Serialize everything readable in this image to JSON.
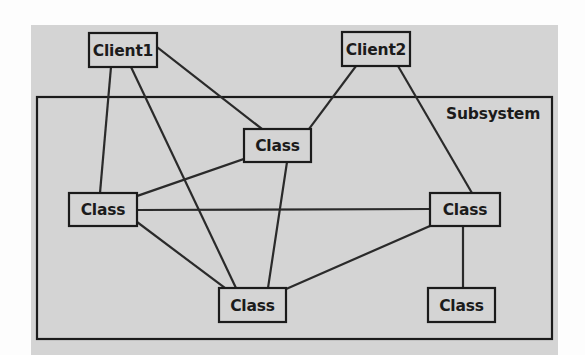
{
  "figure": {
    "background_color": "#fdfdfd",
    "panel": {
      "name": "diagram-panel",
      "fill": "#d4d4d4",
      "x": 31,
      "y": 25,
      "width": 527,
      "height": 330
    },
    "container": {
      "label": "Subsystem",
      "stroke": "#1b1b1b",
      "fill": "#d4d4d4",
      "x": 37,
      "y": 97,
      "width": 515,
      "height": 242,
      "label_x": 446,
      "label_y": 119
    },
    "node_style": {
      "fill": "#d4d4d4",
      "stroke": "#1b1b1b",
      "stroke_width": 2.2,
      "text_color": "#1b1b1b"
    },
    "edge_style": {
      "stroke": "#2a2a2a",
      "stroke_width": 2.2
    }
  },
  "nodes": [
    {
      "id": "client1",
      "label": "Client1",
      "x": 89,
      "y": 33,
      "width": 68,
      "height": 34,
      "group": "outside"
    },
    {
      "id": "client2",
      "label": "Client2",
      "x": 342,
      "y": 32,
      "width": 68,
      "height": 34,
      "group": "outside"
    },
    {
      "id": "class_mid",
      "label": "Class",
      "x": 244,
      "y": 129,
      "width": 67,
      "height": 33,
      "group": "subsystem"
    },
    {
      "id": "class_left",
      "label": "Class",
      "x": 69,
      "y": 193,
      "width": 68,
      "height": 33,
      "group": "subsystem"
    },
    {
      "id": "class_right",
      "label": "Class",
      "x": 430,
      "y": 193,
      "width": 70,
      "height": 33,
      "group": "subsystem"
    },
    {
      "id": "class_bottom",
      "label": "Class",
      "x": 219,
      "y": 288,
      "width": 67,
      "height": 34,
      "group": "subsystem"
    },
    {
      "id": "class_br",
      "label": "Class",
      "x": 428,
      "y": 288,
      "width": 67,
      "height": 34,
      "group": "subsystem"
    }
  ],
  "edges": [
    {
      "id": "e1",
      "from": "client1",
      "to": "class_left",
      "x1": 111,
      "y1": 67,
      "x2": 100,
      "y2": 193
    },
    {
      "id": "e2",
      "from": "client1",
      "to": "class_bottom",
      "x1": 131,
      "y1": 67,
      "x2": 236,
      "y2": 288
    },
    {
      "id": "e3",
      "from": "client1",
      "to": "class_mid",
      "x1": 157,
      "y1": 47,
      "x2": 262,
      "y2": 129
    },
    {
      "id": "e4",
      "from": "client2",
      "to": "class_mid",
      "x1": 356,
      "y1": 66,
      "x2": 309,
      "y2": 129
    },
    {
      "id": "e5",
      "from": "client2",
      "to": "class_right",
      "x1": 398,
      "y1": 66,
      "x2": 472,
      "y2": 193
    },
    {
      "id": "e6",
      "from": "class_mid",
      "to": "class_left",
      "x1": 244,
      "y1": 159,
      "x2": 137,
      "y2": 196
    },
    {
      "id": "e7",
      "from": "class_mid",
      "to": "class_bottom",
      "x1": 287,
      "y1": 162,
      "x2": 268,
      "y2": 288
    },
    {
      "id": "e8",
      "from": "class_left",
      "to": "class_right",
      "x1": 137,
      "y1": 210,
      "x2": 430,
      "y2": 209
    },
    {
      "id": "e9",
      "from": "class_left",
      "to": "class_bottom",
      "x1": 137,
      "y1": 222,
      "x2": 225,
      "y2": 288
    },
    {
      "id": "e10",
      "from": "class_right",
      "to": "class_bottom",
      "x1": 430,
      "y1": 226,
      "x2": 286,
      "y2": 289
    },
    {
      "id": "e11",
      "from": "class_right",
      "to": "class_br",
      "x1": 463,
      "y1": 226,
      "x2": 463,
      "y2": 288
    }
  ]
}
